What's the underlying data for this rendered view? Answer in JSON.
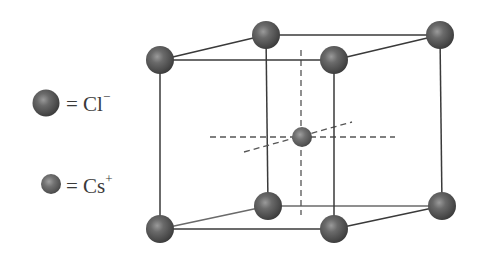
{
  "legend": {
    "items": [
      {
        "symbol": "Cl",
        "charge": "−",
        "prefix": "= ",
        "ion_type": "chloride-anion",
        "size": "large"
      },
      {
        "symbol": "Cs",
        "charge": "+",
        "prefix": "= ",
        "ion_type": "cesium-cation",
        "size": "small"
      }
    ]
  },
  "colors": {
    "sphere_dark": "#3d3d3d",
    "sphere_mid": "#5c5c5c",
    "sphere_light": "#8a8a8a",
    "edge": "#3a3a3a",
    "dashed_axis": "#555555",
    "background": "#ffffff"
  },
  "unit_cell": {
    "corner_ions": "Cl−",
    "center_ion": "Cs+",
    "corners": [
      {
        "id": "front-top-left",
        "x": 160,
        "y": 60
      },
      {
        "id": "front-top-right",
        "x": 334,
        "y": 60
      },
      {
        "id": "front-bottom-left",
        "x": 160,
        "y": 229
      },
      {
        "id": "front-bottom-right",
        "x": 334,
        "y": 229
      },
      {
        "id": "back-top-left",
        "x": 266,
        "y": 35
      },
      {
        "id": "back-top-right",
        "x": 440,
        "y": 35
      },
      {
        "id": "back-bottom-left",
        "x": 268,
        "y": 206
      },
      {
        "id": "back-bottom-right",
        "x": 442,
        "y": 206
      }
    ],
    "center": {
      "id": "body-center",
      "x": 302,
      "y": 137
    }
  }
}
